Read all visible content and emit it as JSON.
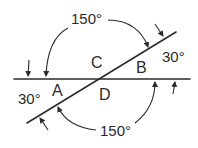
{
  "diagram": {
    "lines": [
      {
        "name": "horizontal-line",
        "description": "straight line"
      },
      {
        "name": "diagonal-line",
        "description": "transversal crossing at 30 degrees"
      }
    ],
    "angle_labels": {
      "A": "A",
      "B": "B",
      "C": "C",
      "D": "D"
    },
    "angle_values": {
      "top_obtuse": "150°",
      "bottom_obtuse": "150°",
      "right_acute": "30°",
      "left_acute": "30°"
    },
    "colors": {
      "stroke": "#2b2b2b",
      "background": "#ffffff"
    }
  }
}
